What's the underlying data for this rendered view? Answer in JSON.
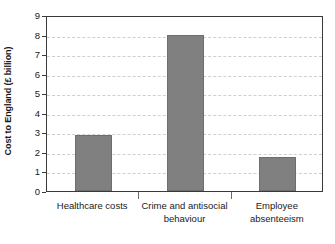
{
  "chart_data": {
    "type": "bar",
    "title": "",
    "subtitle": "",
    "xlabel": "",
    "ylabel": "Cost to England (£ billion)",
    "categories": [
      "Healthcare costs",
      "Crime and antisocial behaviour",
      "Employee absenteeism"
    ],
    "category_lines": [
      [
        "Healthcare costs"
      ],
      [
        "Crime and antisocial",
        "behaviour"
      ],
      [
        "Employee",
        "absenteeism"
      ]
    ],
    "values": [
      2.88,
      8.0,
      1.72
    ],
    "ylim": [
      0,
      9
    ],
    "ytick_labels": [
      "0",
      "1",
      "2",
      "3",
      "4",
      "5",
      "6",
      "7",
      "8",
      "9"
    ],
    "ytick_values": [
      0,
      1,
      2,
      3,
      4,
      5,
      6,
      7,
      8,
      9
    ],
    "grid": "horizontal-dashed",
    "legend": "none",
    "bar_color": "#808080",
    "frame_color": "#3a3a3a",
    "gridline_color": "#cfcfcf",
    "text_color": "#1a1a1a"
  }
}
